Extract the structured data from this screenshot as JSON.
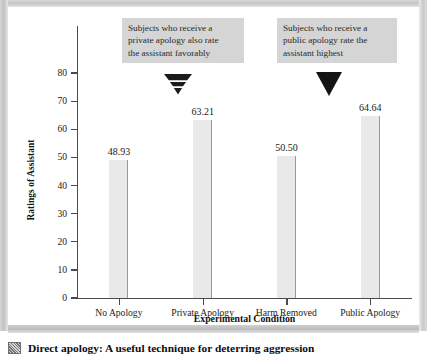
{
  "chart_data": {
    "type": "bar",
    "title": "",
    "xlabel": "Experimental Condition",
    "ylabel": "Ratings of Assistant",
    "categories": [
      "No Apology",
      "Private Apology",
      "Harm Removed",
      "Public Apology"
    ],
    "values": [
      48.93,
      63.21,
      50.5,
      64.64
    ],
    "value_labels": [
      "48.93",
      "63.21",
      "50.50",
      "64.64"
    ],
    "ylim": [
      0,
      80
    ],
    "yticks": [
      0,
      10,
      20,
      30,
      40,
      50,
      60,
      70,
      80
    ],
    "ytick_labels": [
      "0",
      "10",
      "20",
      "30",
      "40",
      "50",
      "60",
      "70",
      "80"
    ],
    "grid": false,
    "legend": "none",
    "bar_color": "#e9e9e9",
    "bar_edge_color": "#9a9a9a",
    "axis_color": "#4a4a4a",
    "annotations": [
      {
        "id": "private-apology-callout",
        "target_category": "Private Apology",
        "arrow": "striped-triangle",
        "lines": [
          "Subjects who receive a",
          "private apology also rate",
          "the assistant favorably"
        ]
      },
      {
        "id": "public-apology-callout",
        "target_category": "Public Apology",
        "arrow": "solid-triangle",
        "lines": [
          "Subjects who receive a",
          "public apology rate the",
          "assistant highest"
        ]
      }
    ]
  },
  "caption": {
    "text": "Direct apology: A useful technique for deterring aggression"
  },
  "colors": {
    "callout_background": "#d5d5d5",
    "frame": "#c4c4c4",
    "surface": "#ffffff"
  }
}
